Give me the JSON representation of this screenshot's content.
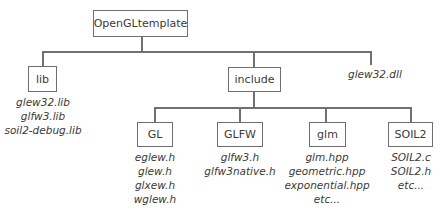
{
  "diagram": {
    "type": "directory-tree",
    "root": {
      "label": "OpenGLtemplate"
    },
    "level1": {
      "lib": {
        "label": "lib",
        "files": [
          "glew32.lib",
          "glfw3.lib",
          "soil2-debug.lib"
        ]
      },
      "include": {
        "label": "include"
      },
      "dll": {
        "label": "glew32.dll"
      }
    },
    "include_children": [
      {
        "label": "GL",
        "files": [
          "eglew.h",
          "glew.h",
          "glxew.h",
          "wglew.h"
        ]
      },
      {
        "label": "GLFW",
        "files": [
          "glfw3.h",
          "glfw3native.h"
        ]
      },
      {
        "label": "glm",
        "files": [
          "glm.hpp",
          "geometric.hpp",
          "exponential.hpp",
          "etc..."
        ]
      },
      {
        "label": "SOIL2",
        "files": [
          "SOIL2.c",
          "SOIL2.h",
          "etc..."
        ]
      }
    ],
    "colors": {
      "line": "#707070",
      "box_border": "#6e6e6e",
      "text": "#3a3a3a"
    }
  }
}
